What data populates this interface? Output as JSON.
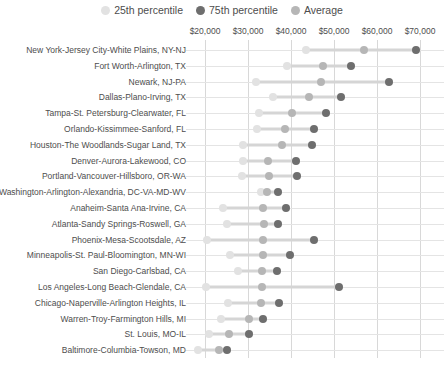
{
  "legend": {
    "position": "top-center",
    "entries": [
      {
        "label": "25th percentile",
        "color": "#e2e2e2",
        "icon": "circle-marker-icon"
      },
      {
        "label": "75th percentile",
        "color": "#6e6e6e",
        "icon": "circle-marker-icon"
      },
      {
        "label": "Average",
        "color": "#b6b6b6",
        "icon": "circle-marker-icon"
      }
    ]
  },
  "colors": {
    "p25": "#e2e2e2",
    "p75": "#6e6e6e",
    "avg": "#b6b6b6",
    "range_line": "#d5d5d5",
    "gridline": "#d8d8d8",
    "baseline": "#e4e4e4",
    "text": "#4d4d4d"
  },
  "chart_data": {
    "type": "scatter",
    "title": "",
    "subtitle": "",
    "xlabel": "",
    "ylabel": "",
    "xlim": [
      15000,
      72000
    ],
    "xticks": [
      20000,
      30000,
      40000,
      50000,
      60000,
      70000
    ],
    "xtick_labels": [
      "$20,000",
      "$30,000",
      "$40,000",
      "$50,000",
      "$60,000",
      "$70,000"
    ],
    "grid": true,
    "legend_position": "top-center",
    "series": [
      {
        "name": "25th percentile",
        "key": "p25",
        "color": "#e2e2e2"
      },
      {
        "name": "Average",
        "key": "avg",
        "color": "#b6b6b6"
      },
      {
        "name": "75th percentile",
        "key": "p75",
        "color": "#6e6e6e"
      }
    ],
    "categories": [
      "New York-Jersey City-White Plains, NY-NJ",
      "Fort Worth-Arlington, TX",
      "Newark, NJ-PA",
      "Dallas-Plano-Irving, TX",
      "Tampa-St. Petersburg-Clearwater, FL",
      "Orlando-Kissimmee-Sanford, FL",
      "Houston-The Woodlands-Sugar Land, TX",
      "Denver-Aurora-Lakewood, CO",
      "Portland-Vancouver-Hillsboro, OR-WA",
      "Washington-Arlington-Alexandria, DC-VA-MD-WV",
      "Anaheim-Santa Ana-Irvine, CA",
      "Atlanta-Sandy Springs-Roswell, GA",
      "Phoenix-Mesa-Scootsdale, AZ",
      "Minneapolis-St. Paul-Bloomington, MN-WI",
      "San Diego-Carlsbad, CA",
      "Los Angeles-Long Beach-Glendale, CA",
      "Chicago-Naperville-Arlington Heights, IL",
      "Warren-Troy-Farmington Hills, MI",
      "St. Louis, MO-IL",
      "Baltimore-Columbia-Towson, MD"
    ],
    "rows": [
      {
        "category": "New York-Jersey City-White Plains, NY-NJ",
        "p25": 43500,
        "avg": 57000,
        "p75": 69000
      },
      {
        "category": "Fort Worth-Arlington, TX",
        "p25": 39000,
        "avg": 47500,
        "p75": 54000
      },
      {
        "category": "Newark, NJ-PA",
        "p25": 31900,
        "avg": 47000,
        "p75": 62800
      },
      {
        "category": "Dallas-Plano-Irving, TX",
        "p25": 35800,
        "avg": 44200,
        "p75": 51600
      },
      {
        "category": "Tampa-St. Petersburg-Clearwater, FL",
        "p25": 32600,
        "avg": 40200,
        "p75": 48100
      },
      {
        "category": "Orlando-Kissimmee-Sanford, FL",
        "p25": 32100,
        "avg": 38600,
        "p75": 45300
      },
      {
        "category": "Houston-The Woodlands-Sugar Land, TX",
        "p25": 28800,
        "avg": 37900,
        "p75": 44900
      },
      {
        "category": "Denver-Aurora-Lakewood, CO",
        "p25": 28800,
        "avg": 34600,
        "p75": 41200
      },
      {
        "category": "Portland-Vancouver-Hillsboro, OR-WA",
        "p25": 28600,
        "avg": 34900,
        "p75": 41400
      },
      {
        "category": "Washington-Arlington-Alexandria, DC-VA-MD-WV",
        "p25": 33000,
        "avg": 34400,
        "p75": 37000
      },
      {
        "category": "Anaheim-Santa Ana-Irvine, CA",
        "p25": 24200,
        "avg": 33500,
        "p75": 38800
      },
      {
        "category": "Atlanta-Sandy Springs-Roswell, GA",
        "p25": 25100,
        "avg": 33700,
        "p75": 37000
      },
      {
        "category": "Phoenix-Mesa-Scootsdale, AZ",
        "p25": 20500,
        "avg": 33500,
        "p75": 45300
      },
      {
        "category": "Minneapolis-St. Paul-Bloomington, MN-WI",
        "p25": 25800,
        "avg": 33500,
        "p75": 39800
      },
      {
        "category": "San Diego-Carlsbad, CA",
        "p25": 27700,
        "avg": 33300,
        "p75": 36700
      },
      {
        "category": "Los Angeles-Long Beach-Glendale, CA",
        "p25": 20200,
        "avg": 33300,
        "p75": 51200
      },
      {
        "category": "Chicago-Naperville-Arlington Heights, IL",
        "p25": 25300,
        "avg": 33000,
        "p75": 37200
      },
      {
        "category": "Warren-Troy-Farmington Hills, MI",
        "p25": 23700,
        "avg": 30200,
        "p75": 33500
      },
      {
        "category": "St. Louis, MO-IL",
        "p25": 20900,
        "avg": 25600,
        "p75": 30200
      },
      {
        "category": "Baltimore-Columbia-Towson, MD",
        "p25": 18400,
        "avg": 23300,
        "p75": 25100
      }
    ]
  }
}
